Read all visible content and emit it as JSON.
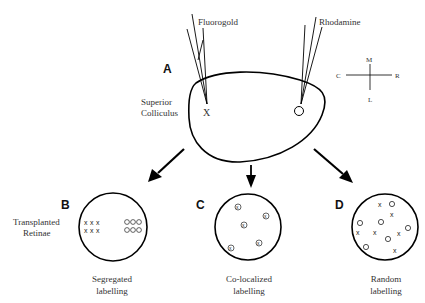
{
  "panels": {
    "A": {
      "letter": "A",
      "structure_label_1": "Superior",
      "structure_label_2": "Colliculus",
      "tracer_left": "Fluorogold",
      "tracer_right": "Rhodamine",
      "marker_left": "X",
      "orientation": {
        "top": "M",
        "bottom": "L",
        "left": "C",
        "right": "R"
      }
    },
    "B": {
      "letter": "B",
      "side_label_1": "Transplanted",
      "side_label_2": "Retinae",
      "caption_1": "Segregated",
      "caption_2": "labelling"
    },
    "C": {
      "letter": "C",
      "caption_1": "Co-localized",
      "caption_2": "labelling"
    },
    "D": {
      "letter": "D",
      "caption_1": "Random",
      "caption_2": "labelling"
    }
  }
}
